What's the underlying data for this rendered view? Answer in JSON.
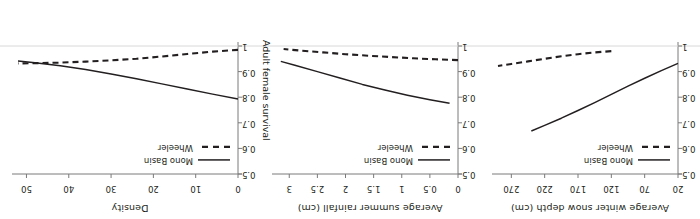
{
  "figure": {
    "rotation_degrees": 180,
    "background": "#ffffff",
    "ink_color": "#231f20",
    "axis_color": "#7a7a7a",
    "n_panels": 3
  },
  "shared_y_axis": {
    "label": "Adult female survival",
    "ticks": [
      "0.5",
      "0.6",
      "0.7",
      "0.8",
      "0.9",
      "1"
    ],
    "tick_values": [
      0.5,
      0.6,
      0.7,
      0.8,
      0.9,
      1.0
    ],
    "min": 0.5,
    "max": 1.0,
    "label_panel_index": 2
  },
  "legend": {
    "entries": [
      {
        "label": "Mono Basin",
        "style": "solid",
        "color": "#231f20"
      },
      {
        "label": "Wheeler",
        "style": "dashed",
        "color": "#231f20"
      }
    ]
  },
  "chart_data": {
    "type": "line",
    "title": "",
    "ylabel": "Adult female survival",
    "ylim": [
      0.5,
      1.0
    ],
    "yticks": [
      0.5,
      0.6,
      0.7,
      0.8,
      0.9,
      1.0
    ],
    "grid": false,
    "legend_position": "top-left-inside",
    "panels": [
      {
        "index": 0,
        "xlabel": "Average winter snow depth (cm)",
        "xticks": [
          20,
          70,
          120,
          170,
          220,
          270
        ],
        "xtick_labels": [
          "20",
          "70",
          "120",
          "170",
          "220",
          "270"
        ],
        "xlim": [
          20,
          290
        ],
        "series": [
          {
            "name": "Mono Basin",
            "style": "solid",
            "x": [
              20,
              45,
              70,
              95,
              120,
              145,
              170,
              195,
              220,
              240
            ],
            "y": [
              0.932,
              0.904,
              0.874,
              0.843,
              0.811,
              0.779,
              0.748,
              0.718,
              0.69,
              0.668
            ]
          },
          {
            "name": "Wheeler",
            "style": "dashed",
            "x": [
              120,
              145,
              170,
              195,
              220,
              245,
              270,
              290
            ],
            "y": [
              0.98,
              0.975,
              0.968,
              0.96,
              0.95,
              0.94,
              0.93,
              0.922
            ]
          }
        ]
      },
      {
        "index": 1,
        "xlabel": "Average summer rainfall (cm)",
        "xticks": [
          0,
          0.5,
          1,
          1.5,
          2,
          2.5,
          3
        ],
        "xtick_labels": [
          "0",
          "0.5",
          "1",
          "1.5",
          "2",
          "2.5",
          "3"
        ],
        "xlim": [
          0,
          3.2
        ],
        "series": [
          {
            "name": "Mono Basin",
            "style": "solid",
            "x": [
              0.15,
              0.5,
              0.9,
              1.3,
              1.7,
              2.1,
              2.5,
              2.9,
              3.15
            ],
            "y": [
              0.776,
              0.79,
              0.808,
              0.828,
              0.85,
              0.875,
              0.9,
              0.925,
              0.94
            ]
          },
          {
            "name": "Wheeler",
            "style": "dashed",
            "x": [
              0.0,
              0.4,
              0.8,
              1.2,
              1.6,
              2.0,
              2.4,
              2.8,
              3.1
            ],
            "y": [
              0.945,
              0.948,
              0.952,
              0.957,
              0.962,
              0.968,
              0.975,
              0.982,
              0.988
            ]
          }
        ]
      },
      {
        "index": 2,
        "xlabel": "Density",
        "xticks": [
          0,
          10,
          20,
          30,
          40,
          50
        ],
        "xtick_labels": [
          "0",
          "10",
          "20",
          "30",
          "40",
          "50"
        ],
        "xlim": [
          0,
          52
        ],
        "series": [
          {
            "name": "Mono Basin",
            "style": "solid",
            "x": [
              0,
              6,
              12,
              18,
              24,
              30,
              36,
              42,
              48,
              52
            ],
            "y": [
              0.793,
              0.812,
              0.832,
              0.852,
              0.872,
              0.891,
              0.908,
              0.923,
              0.935,
              0.941
            ]
          },
          {
            "name": "Wheeler",
            "style": "dashed",
            "x": [
              0,
              6,
              12,
              18,
              24,
              30,
              36,
              42,
              48,
              52
            ],
            "y": [
              0.985,
              0.978,
              0.969,
              0.959,
              0.95,
              0.944,
              0.939,
              0.935,
              0.933,
              0.932
            ]
          }
        ]
      }
    ]
  }
}
